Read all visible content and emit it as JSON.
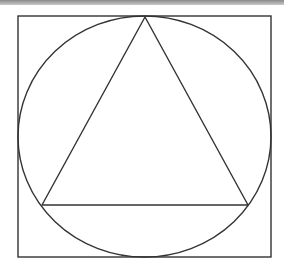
{
  "figure": {
    "shapes": [
      "square",
      "circle",
      "triangle"
    ],
    "stroke_color": "#333333",
    "background_color": "#ffffff",
    "top_border_color": "#9a9a9a"
  }
}
